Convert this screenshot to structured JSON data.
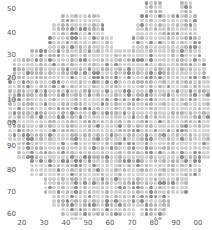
{
  "map": {
    "type": "dot-density grid",
    "dot_colors": {
      "light": "#cfcfcf",
      "mid": "#b5b5b5",
      "dark": "#8f8f8f"
    },
    "grid_spacing_px": 4.4,
    "outline_color": "#bdbdbd"
  },
  "axes": {
    "y_ticks": [
      {
        "label": "50",
        "y": 5
      },
      {
        "label": "40",
        "y": 29
      },
      {
        "label": "30",
        "y": 51
      },
      {
        "label": "20",
        "y": 74
      },
      {
        "label": "10",
        "y": 96
      },
      {
        "label": "00",
        "y": 119
      },
      {
        "label": "90",
        "y": 142
      },
      {
        "label": "80",
        "y": 166
      },
      {
        "label": "70",
        "y": 188
      },
      {
        "label": "60",
        "y": 210
      }
    ],
    "x_ticks": [
      {
        "label": "20",
        "x": 22
      },
      {
        "label": "30",
        "x": 44
      },
      {
        "label": "40",
        "x": 66
      },
      {
        "label": "50",
        "x": 88
      },
      {
        "label": "60",
        "x": 110
      },
      {
        "label": "70",
        "x": 132
      },
      {
        "label": "80",
        "x": 154
      },
      {
        "label": "90",
        "x": 176
      },
      {
        "label": "00",
        "x": 198
      }
    ]
  },
  "shape_rows": [
    {
      "y0": 0,
      "y1": 10,
      "spans": [
        [
          142,
          162
        ],
        [
          178,
          190
        ]
      ]
    },
    {
      "y0": 10,
      "y1": 22,
      "spans": [
        [
          60,
          98
        ],
        [
          138,
          194
        ]
      ]
    },
    {
      "y0": 22,
      "y1": 34,
      "spans": [
        [
          52,
          104
        ],
        [
          134,
          196
        ]
      ]
    },
    {
      "y0": 34,
      "y1": 46,
      "spans": [
        [
          44,
          112
        ],
        [
          128,
          198
        ]
      ]
    },
    {
      "y0": 46,
      "y1": 58,
      "spans": [
        [
          28,
          202
        ]
      ]
    },
    {
      "y0": 58,
      "y1": 72,
      "spans": [
        [
          10,
          206
        ]
      ]
    },
    {
      "y0": 72,
      "y1": 140,
      "spans": [
        [
          6,
          210
        ]
      ]
    },
    {
      "y0": 140,
      "y1": 158,
      "spans": [
        [
          16,
          208
        ]
      ]
    },
    {
      "y0": 158,
      "y1": 176,
      "spans": [
        [
          30,
          200
        ]
      ]
    },
    {
      "y0": 176,
      "y1": 192,
      "spans": [
        [
          40,
          186
        ]
      ]
    },
    {
      "y0": 192,
      "y1": 204,
      "spans": [
        [
          52,
          170
        ]
      ]
    },
    {
      "y0": 204,
      "y1": 214,
      "spans": [
        [
          58,
          132
        ],
        [
          140,
          166
        ]
      ]
    },
    {
      "y0": 214,
      "y1": 220,
      "spans": [
        [
          70,
          80
        ],
        [
          150,
          160
        ]
      ]
    }
  ],
  "seed": 1337
}
